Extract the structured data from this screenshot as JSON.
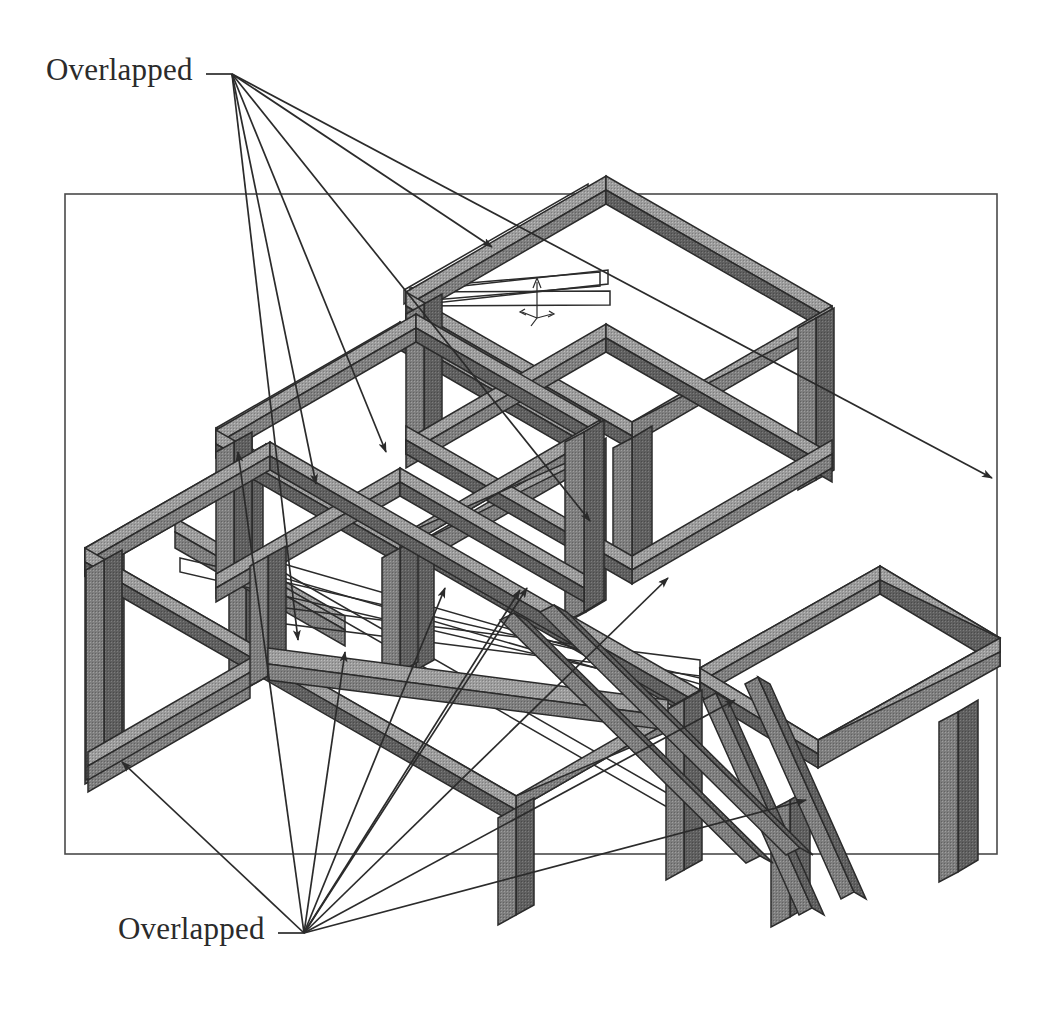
{
  "document": {
    "title": "Overlapped",
    "view_type": "isometric",
    "background_color": "#ffffff",
    "line_color": "#2b2b2b",
    "beam_fill_top": "#9a9a9a",
    "beam_fill_side": "#6e6e6e",
    "beam_fill_dark": "#565656",
    "beam_fill_face": "#848484",
    "border_color": "#4a4a4a"
  },
  "viewport_border": {
    "name": "drawing-view-border",
    "x": 65,
    "y": 194,
    "width": 932,
    "height": 660
  },
  "callouts": [
    {
      "id": "callout-top",
      "label": "Overlapped",
      "text_x": 46,
      "text_y": 52,
      "anchor_x": 232,
      "anchor_y": 74,
      "leader_stub_x1": 206,
      "leader_stub_x2": 232,
      "targets": [
        {
          "x": 298,
          "y": 640,
          "name": "joint-left-mid-column"
        },
        {
          "x": 316,
          "y": 484,
          "name": "joint-left-upper-corner"
        },
        {
          "x": 386,
          "y": 452,
          "name": "joint-mid-frame-left"
        },
        {
          "x": 492,
          "y": 247,
          "name": "joint-top-platform-left"
        },
        {
          "x": 590,
          "y": 521,
          "name": "joint-center-column-top"
        },
        {
          "x": 992,
          "y": 478,
          "name": "joint-right-platform-far"
        }
      ]
    },
    {
      "id": "callout-bottom",
      "label": "Overlapped",
      "text_x": 118,
      "text_y": 911,
      "anchor_x": 304,
      "anchor_y": 933,
      "leader_stub_x1": 278,
      "leader_stub_x2": 304,
      "targets": [
        {
          "x": 122,
          "y": 762,
          "name": "joint-left-foot"
        },
        {
          "x": 238,
          "y": 452,
          "name": "joint-left-top-rail"
        },
        {
          "x": 345,
          "y": 652,
          "name": "joint-left-lower-rail"
        },
        {
          "x": 445,
          "y": 588,
          "name": "joint-front-rail-mid"
        },
        {
          "x": 520,
          "y": 590,
          "name": "joint-front-rail-right"
        },
        {
          "x": 527,
          "y": 588,
          "name": "joint-front-rail-right-2"
        },
        {
          "x": 668,
          "y": 578,
          "name": "joint-center-right-column"
        },
        {
          "x": 735,
          "y": 700,
          "name": "joint-brace-lower"
        },
        {
          "x": 806,
          "y": 800,
          "name": "joint-right-foot"
        }
      ]
    }
  ],
  "origin_marker": {
    "name": "coordinate-triad",
    "x": 537,
    "y": 282,
    "height": 38
  },
  "structure": {
    "name": "stepped-frame-weldment",
    "description": "Three-tier stepped welded tube frame shown in isometric projection",
    "tiers": 3,
    "beam_thickness_px": 13
  }
}
